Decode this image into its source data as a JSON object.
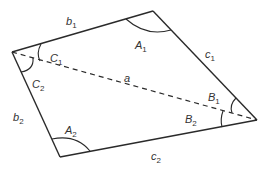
{
  "diagram": {
    "type": "quadrilateral",
    "stroke_color": "#2a2a2a",
    "label_color": "#333333",
    "vertices": {
      "left": [
        12,
        52
      ],
      "top": [
        153,
        11
      ],
      "right": [
        257,
        120
      ],
      "bottom": [
        60,
        157
      ]
    },
    "labels": {
      "b1": {
        "main": "b",
        "sub": "1"
      },
      "c1": {
        "main": "c",
        "sub": "1"
      },
      "b2": {
        "main": "b",
        "sub": "2"
      },
      "c2": {
        "main": "c",
        "sub": "2"
      },
      "a": {
        "main": "a",
        "sub": ""
      },
      "A1": {
        "main": "A",
        "sub": "1"
      },
      "A2": {
        "main": "A",
        "sub": "2"
      },
      "B1": {
        "main": "B",
        "sub": "1"
      },
      "B2": {
        "main": "B",
        "sub": "2"
      },
      "C1": {
        "main": "C",
        "sub": "1"
      },
      "C2": {
        "main": "C",
        "sub": "2"
      }
    },
    "diagonal": {
      "from": "left",
      "to": "right",
      "style": "dashed",
      "label": "a"
    }
  }
}
